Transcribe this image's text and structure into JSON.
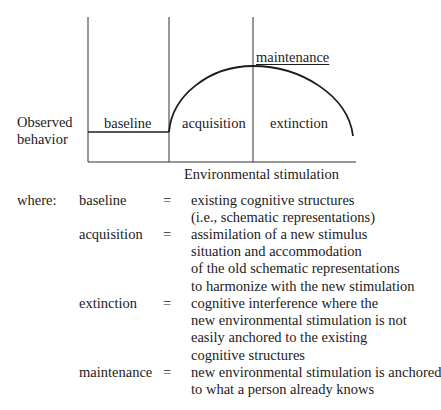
{
  "diagram": {
    "y_axis_label_line1": "Observed",
    "y_axis_label_line2": "behavior",
    "x_axis_label": "Environmental stimulation",
    "phases": {
      "baseline": "baseline",
      "acquisition": "acquisition",
      "extinction": "extinction",
      "maintenance": "maintenance"
    },
    "line_color": "#1c1c1c"
  },
  "legend": {
    "where_label": "where:",
    "entries": [
      {
        "term": "baseline",
        "eq": "=",
        "lines": [
          "existing cognitive structures",
          "(i.e., schematic representations)"
        ]
      },
      {
        "term": "acquisition",
        "eq": "=",
        "lines": [
          "assimilation of a new stimulus",
          "situation and accommodation",
          "of the old schematic representations",
          "to harmonize with the new stimulation"
        ]
      },
      {
        "term": "extinction",
        "eq": "=",
        "lines": [
          "cognitive interference where the",
          "new environmental stimulation is not",
          "easily anchored to the existing",
          "cognitive structures"
        ]
      },
      {
        "term": "maintenance",
        "eq": "=",
        "lines": [
          "new environmental stimulation is anchored",
          "to what a person already knows"
        ]
      }
    ]
  }
}
